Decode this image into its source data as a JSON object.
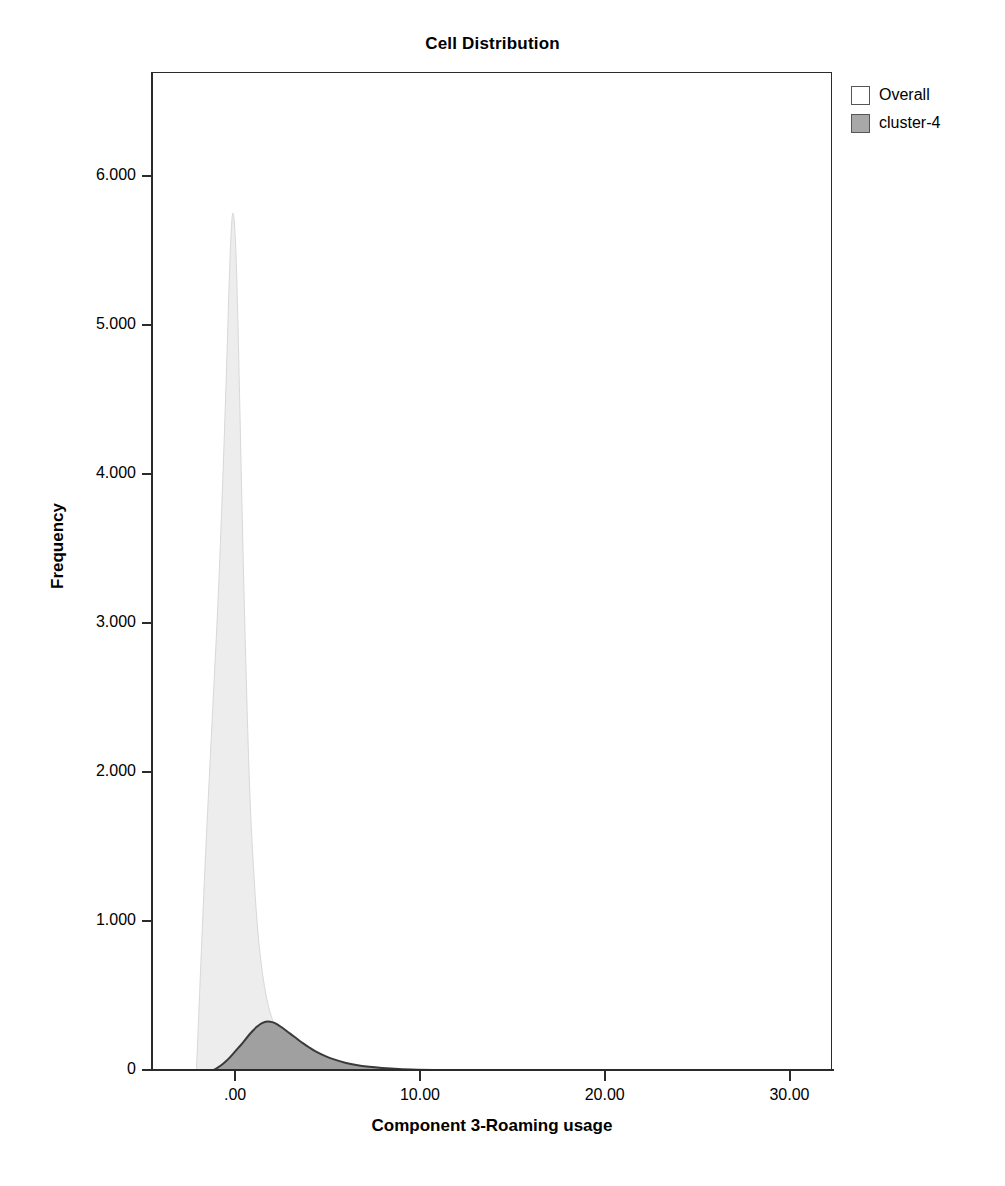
{
  "chart_data": {
    "type": "area",
    "title": "Cell Distribution",
    "xlabel": "Component 3-Roaming usage",
    "ylabel": "Frequency",
    "xlim": [
      -4.5,
      32.3
    ],
    "ylim": [
      0,
      6.7
    ],
    "grid": false,
    "legend_position": "top-right",
    "x_ticks": [
      {
        "value": 0,
        "label": ".00"
      },
      {
        "value": 10,
        "label": "10.00"
      },
      {
        "value": 20,
        "label": "20.00"
      },
      {
        "value": 30,
        "label": "30.00"
      }
    ],
    "y_ticks": [
      {
        "value": 0,
        "label": "0"
      },
      {
        "value": 1000,
        "label": "1.000"
      },
      {
        "value": 2000,
        "label": "2.000"
      },
      {
        "value": 3000,
        "label": "3.000"
      },
      {
        "value": 4000,
        "label": "4.000"
      },
      {
        "value": 5000,
        "label": "5.000"
      },
      {
        "value": 6000,
        "label": "6.000"
      }
    ],
    "series": [
      {
        "name": "Overall",
        "fill_color": "#ededed",
        "line_color": "#d8d8d8",
        "peak_x": -0.2,
        "peak_y": 5.75,
        "x": [
          -2.15,
          -2.0,
          -1.8,
          -1.6,
          -1.4,
          -1.2,
          -1.0,
          -0.85,
          -0.7,
          -0.55,
          -0.4,
          -0.3,
          -0.2,
          -0.1,
          0.0,
          0.1,
          0.2,
          0.35,
          0.5,
          0.7,
          0.9,
          1.2,
          1.6,
          2.1,
          2.7,
          3.4,
          4.2,
          5.2,
          6.5,
          8.0,
          10.0
        ],
        "y": [
          0.0,
          0.45,
          1.05,
          1.6,
          2.1,
          2.6,
          3.1,
          3.55,
          4.05,
          4.6,
          5.2,
          5.55,
          5.75,
          5.7,
          5.45,
          5.0,
          4.45,
          3.6,
          2.85,
          2.0,
          1.45,
          0.9,
          0.52,
          0.3,
          0.18,
          0.1,
          0.06,
          0.035,
          0.02,
          0.01,
          0.0
        ]
      },
      {
        "name": "cluster-4",
        "fill_color": "#a0a0a0",
        "line_color": "#3a3a3a",
        "peak_x": 1.7,
        "peak_y": 0.33,
        "x": [
          -1.35,
          -1.1,
          -0.85,
          -0.6,
          -0.35,
          -0.1,
          0.15,
          0.4,
          0.65,
          0.9,
          1.15,
          1.4,
          1.7,
          1.95,
          2.2,
          2.5,
          2.8,
          3.15,
          3.5,
          3.9,
          4.3,
          4.8,
          5.3,
          5.9,
          6.5,
          7.2,
          7.9,
          8.8,
          9.8,
          11.0,
          12.5,
          14.5,
          17.0,
          20.0,
          24.0,
          28.0,
          31.5
        ],
        "y": [
          0.0,
          0.015,
          0.035,
          0.06,
          0.09,
          0.125,
          0.16,
          0.195,
          0.235,
          0.27,
          0.3,
          0.322,
          0.332,
          0.328,
          0.315,
          0.29,
          0.262,
          0.23,
          0.196,
          0.163,
          0.132,
          0.102,
          0.078,
          0.056,
          0.04,
          0.028,
          0.02,
          0.013,
          0.009,
          0.006,
          0.004,
          0.0025,
          0.0015,
          0.001,
          0.0006,
          0.0003,
          0.0
        ]
      }
    ]
  },
  "legend": {
    "items": [
      {
        "label": "Overall",
        "swatch_color": "#ffffff"
      },
      {
        "label": "cluster-4",
        "swatch_color": "#a8a8a8"
      }
    ]
  }
}
